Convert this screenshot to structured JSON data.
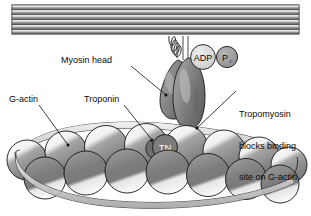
{
  "figure": {
    "background": "#ffffff",
    "width": 311,
    "height": 216
  },
  "labels": {
    "myosin_head": "Myosin head",
    "g_actin": "G-actin",
    "troponin": "Troponin",
    "tropomyosin_line1": "Tropomyosin",
    "tropomyosin_line2": "blocks binding",
    "tropomyosin_line3": "site on G-actin"
  },
  "markers": {
    "adp": "ADP",
    "pi_main": "P",
    "pi_sub": "i",
    "troponin_abbrev": "TN"
  },
  "colors": {
    "outline": "#111111",
    "thick_filament_dark": "#6e6e6e",
    "thick_filament_light": "#efefef",
    "bead_gray": "#8d8d8d",
    "bead_light": "#f2f2f2",
    "bead_dark": "#6b6b6b",
    "head_gray": "#8a8a8a",
    "head_dark": "#6a6a6a",
    "adp_fill": "#d6d6d6",
    "pi_fill": "#9a9a9a",
    "tn_fill": "#707070",
    "tropomyosin_fill": "#d9d9d9",
    "text": "#0a0a0a"
  },
  "structures": {
    "thick_filament": {
      "name": "myosin thick filament",
      "stripe_count": 6,
      "x": 12,
      "y": 5,
      "width": 287,
      "height": 30
    },
    "myosin_neck": {
      "name": "coiled myosin neck",
      "coil_loops": 4
    },
    "myosin_head": {
      "name": "myosin head",
      "lobes": 2
    },
    "actin_chain": {
      "name": "F-actin double helix of G-actin monomers",
      "back_row_beads": 8,
      "front_row_beads": 7
    },
    "tropomyosin": {
      "name": "tropomyosin strands",
      "strand_count": 2
    }
  }
}
